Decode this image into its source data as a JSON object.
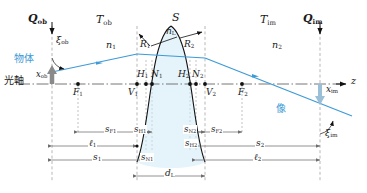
{
  "figure": {
    "type": "optical-ray-diagram",
    "colors": {
      "ray": "#3d9ad6",
      "lens_fill": "#cfe9f5",
      "lens_outline": "#111111",
      "axis": "#7a7a7a",
      "dimension": "#6e6e6e",
      "object_arrow": "#8a8a8a",
      "label": "#1a1a1a"
    }
  },
  "planes": {
    "q_ob": "Q",
    "q_ob_sub": "ob",
    "q_im": "Q",
    "q_im_sub": "im",
    "t_ob": "T",
    "t_ob_sub": "ob",
    "t_im": "T",
    "t_im_sub": "im",
    "s_surface": "S"
  },
  "media": {
    "n1": "n",
    "n1_sub": "1",
    "n2": "n",
    "n2_sub": "2",
    "nL": "n",
    "nL_sub": "L"
  },
  "radii": {
    "r1": "R",
    "r1_sub": "1",
    "r2": "R",
    "r2_sub": "2"
  },
  "cardinal_points": {
    "v1": "V",
    "v1_sub": "1",
    "v2": "V",
    "v2_sub": "2",
    "h1": "H",
    "h1_sub": "1",
    "h2": "H",
    "h2_sub": "2",
    "n1p": "N",
    "n1p_sub": "1",
    "n2p": "N",
    "n2p_sub": "2",
    "f1": "F",
    "f1_sub": "1",
    "f2": "F",
    "f2_sub": "2"
  },
  "japanese": {
    "object": "物体",
    "optical_axis": "光軸",
    "image": "像"
  },
  "angles": {
    "xi_ob": "ξ",
    "xi_ob_sub": "ob",
    "xi_im": "ξ",
    "xi_im_sub": "im"
  },
  "heights": {
    "x_ob": "x",
    "x_ob_sub": "ob",
    "x_im": "x",
    "x_im_sub": "im"
  },
  "axis_label": "z",
  "dimensions": [
    {
      "name": "s_F1",
      "sym": "s",
      "sub": "F1"
    },
    {
      "name": "s_H1",
      "sym": "s",
      "sub": "H1"
    },
    {
      "name": "s_N1",
      "sym": "s",
      "sub": "N1"
    },
    {
      "name": "ell_1",
      "sym": "ℓ",
      "sub": "1"
    },
    {
      "name": "s_1",
      "sym": "s",
      "sub": "1"
    },
    {
      "name": "d_L",
      "sym": "d",
      "sub": "L"
    },
    {
      "name": "s_N2",
      "sym": "s",
      "sub": "N2"
    },
    {
      "name": "s_F2",
      "sym": "s",
      "sub": "F2"
    },
    {
      "name": "s_H2",
      "sym": "s",
      "sub": "H2"
    },
    {
      "name": "s_2",
      "sym": "s",
      "sub": "2"
    },
    {
      "name": "ell_2",
      "sym": "ℓ",
      "sub": "2"
    }
  ]
}
